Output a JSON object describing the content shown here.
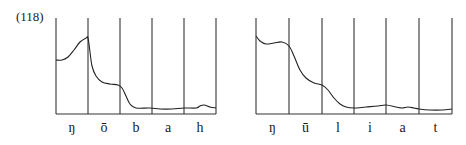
{
  "example_number": "(118)",
  "figures": [
    {
      "id": "left",
      "boundaries_x": [
        56,
        88,
        120,
        152,
        184,
        216
      ],
      "baseline_y": 114,
      "top_y": 18,
      "segments": [
        "ŋ",
        "ō",
        "b",
        "a",
        "h"
      ],
      "contour_points": [
        [
          56,
          60
        ],
        [
          62,
          60
        ],
        [
          68,
          57
        ],
        [
          74,
          50
        ],
        [
          80,
          42
        ],
        [
          86,
          38
        ],
        [
          88,
          38
        ],
        [
          90,
          52
        ],
        [
          92,
          66
        ],
        [
          96,
          76
        ],
        [
          102,
          82
        ],
        [
          110,
          84
        ],
        [
          118,
          85
        ],
        [
          122,
          88
        ],
        [
          126,
          96
        ],
        [
          130,
          104
        ],
        [
          136,
          108
        ],
        [
          150,
          108
        ],
        [
          160,
          109
        ],
        [
          172,
          109
        ],
        [
          184,
          108
        ],
        [
          196,
          108
        ],
        [
          200,
          106
        ],
        [
          204,
          105
        ],
        [
          210,
          107
        ],
        [
          216,
          108
        ]
      ]
    },
    {
      "id": "right",
      "boundaries_x": [
        256,
        289,
        322,
        354,
        386,
        419,
        452
      ],
      "baseline_y": 114,
      "top_y": 18,
      "segments": [
        "ŋ",
        "ū",
        "l",
        "i",
        "a",
        "t"
      ],
      "contour_points": [
        [
          256,
          36
        ],
        [
          260,
          41
        ],
        [
          266,
          44
        ],
        [
          274,
          43
        ],
        [
          282,
          42
        ],
        [
          289,
          46
        ],
        [
          294,
          56
        ],
        [
          300,
          70
        ],
        [
          306,
          78
        ],
        [
          314,
          83
        ],
        [
          322,
          85
        ],
        [
          328,
          90
        ],
        [
          334,
          98
        ],
        [
          340,
          104
        ],
        [
          346,
          107
        ],
        [
          354,
          108
        ],
        [
          366,
          107
        ],
        [
          378,
          106
        ],
        [
          386,
          105
        ],
        [
          396,
          107
        ],
        [
          402,
          108
        ],
        [
          408,
          107
        ],
        [
          414,
          108
        ],
        [
          419,
          109
        ],
        [
          430,
          110
        ],
        [
          442,
          110
        ],
        [
          452,
          109
        ]
      ]
    }
  ],
  "colors": {
    "line": "#333333",
    "background": "#ffffff"
  }
}
